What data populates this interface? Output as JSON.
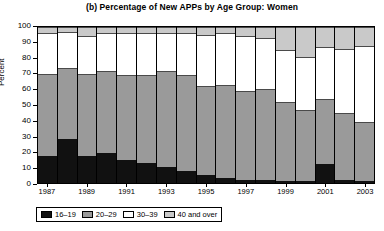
{
  "chart_data": {
    "type": "bar",
    "subtype": "stacked-bar-100",
    "title": "(b) Percentage of New APPs by Age Group: Women",
    "xlabel": "",
    "ylabel": "Percent",
    "ylim": [
      0,
      100
    ],
    "ytick_labels": [
      "0",
      "10",
      "20",
      "30",
      "40",
      "50",
      "60",
      "70",
      "80",
      "90",
      "100"
    ],
    "ytick_values": [
      0,
      10,
      20,
      30,
      40,
      50,
      60,
      70,
      80,
      90,
      100
    ],
    "grid": false,
    "legend_position": "below-plot",
    "categories": [
      "1987",
      "1988",
      "1989",
      "1990",
      "1991",
      "1992",
      "1993",
      "1994",
      "1995",
      "1996",
      "1997",
      "1998",
      "1999",
      "2000",
      "2001",
      "2002",
      "2003"
    ],
    "xtick_labels": [
      "1987",
      "1989",
      "1991",
      "1993",
      "1995",
      "1997",
      "1999",
      "2001",
      "2003"
    ],
    "xtick_categories": [
      "1987",
      "1989",
      "1991",
      "1993",
      "1995",
      "1997",
      "1999",
      "2001",
      "2003"
    ],
    "series": [
      {
        "name": "16–19",
        "color": "#111111",
        "values": [
          17,
          28,
          17,
          19,
          15,
          13,
          10,
          8,
          5,
          3,
          2,
          2,
          1,
          1,
          12,
          2,
          1
        ]
      },
      {
        "name": "20–29",
        "color": "#9a9a9a",
        "values": [
          53,
          46,
          53,
          53,
          54,
          56,
          62,
          61,
          57,
          60,
          57,
          58,
          51,
          46,
          42,
          43,
          38
        ]
      },
      {
        "name": "30–39",
        "color": "#ffffff",
        "values": [
          26,
          23,
          24,
          24,
          27,
          27,
          24,
          27,
          33,
          33,
          35,
          33,
          33,
          34,
          33,
          41,
          49
        ]
      },
      {
        "name": "40 and over",
        "color": "#c9c9c9",
        "values": [
          4,
          3,
          6,
          4,
          4,
          4,
          4,
          4,
          5,
          4,
          6,
          7,
          15,
          19,
          13,
          14,
          12
        ]
      }
    ]
  },
  "legend": {
    "items": [
      {
        "label": "16–19",
        "color": "#111111"
      },
      {
        "label": "20–29",
        "color": "#9a9a9a"
      },
      {
        "label": "30–39",
        "color": "#ffffff"
      },
      {
        "label": "40 and over",
        "color": "#c9c9c9"
      }
    ]
  }
}
